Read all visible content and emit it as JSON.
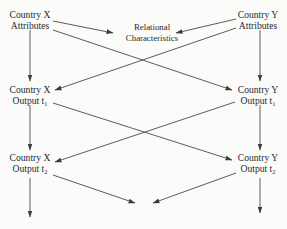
{
  "diagram": {
    "type": "flow",
    "nodes": {
      "x_attributes": {
        "line1": "Country X",
        "line2": "Attributes"
      },
      "y_attributes": {
        "line1": "Country Y",
        "line2": "Attributes"
      },
      "relational": {
        "line1": "Relational",
        "line2": "Characteristics"
      },
      "x_output_t1": {
        "line1": "Country X",
        "line2": "Output t",
        "sub": "1"
      },
      "y_output_t1": {
        "line1": "Country Y",
        "line2": "Output t",
        "sub": "1"
      },
      "x_output_t2": {
        "line1": "Country X",
        "line2": "Output t",
        "sub": "2"
      },
      "y_output_t2": {
        "line1": "Country Y",
        "line2": "Output t",
        "sub": "2"
      }
    },
    "edges": [
      {
        "from": "x_attributes",
        "to": "relational"
      },
      {
        "from": "y_attributes",
        "to": "relational"
      },
      {
        "from": "x_attributes",
        "to": "y_output_t1"
      },
      {
        "from": "y_attributes",
        "to": "x_output_t1"
      },
      {
        "from": "x_attributes",
        "to": "x_output_t1"
      },
      {
        "from": "y_attributes",
        "to": "y_output_t1"
      },
      {
        "from": "x_output_t1",
        "to": "y_output_t2"
      },
      {
        "from": "y_output_t1",
        "to": "x_output_t2"
      },
      {
        "from": "x_output_t1",
        "to": "x_output_t2"
      },
      {
        "from": "y_output_t1",
        "to": "y_output_t2"
      },
      {
        "from": "x_output_t2",
        "to": "continuation"
      },
      {
        "from": "y_output_t2",
        "to": "continuation"
      },
      {
        "from": "x_output_t2",
        "to": "below"
      },
      {
        "from": "y_output_t2",
        "to": "below"
      }
    ]
  }
}
